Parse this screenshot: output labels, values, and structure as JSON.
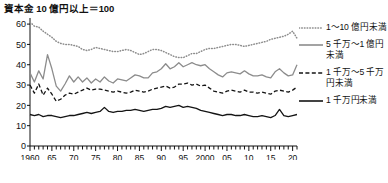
{
  "chart_data": {
    "type": "line",
    "title": "資本金 10 億円以上＝100",
    "xlabel": "",
    "ylabel": "",
    "xlim": [
      1960,
      2021
    ],
    "ylim": [
      0,
      63
    ],
    "yticks": [
      0,
      10,
      20,
      30,
      40,
      50,
      60
    ],
    "ytick_labels": [
      "0",
      "10",
      "20",
      "30",
      "40",
      "50",
      "60"
    ],
    "xticks": [
      1960,
      1965,
      1970,
      1975,
      1980,
      1985,
      1990,
      1995,
      2000,
      2005,
      2010,
      2015,
      2020
    ],
    "xtick_labels": [
      "1960",
      "65",
      "70",
      "75",
      "80",
      "85",
      "90",
      "95",
      "2000",
      "05",
      "10",
      "15",
      "20"
    ],
    "minor_tick_interval": 1,
    "grid": false,
    "legend_position": "right",
    "x": [
      1960,
      1961,
      1962,
      1963,
      1964,
      1965,
      1966,
      1967,
      1968,
      1969,
      1970,
      1971,
      1972,
      1973,
      1974,
      1975,
      1976,
      1977,
      1978,
      1979,
      1980,
      1981,
      1982,
      1983,
      1984,
      1985,
      1986,
      1987,
      1988,
      1989,
      1990,
      1991,
      1992,
      1993,
      1994,
      1995,
      1996,
      1997,
      1998,
      1999,
      2000,
      2001,
      2002,
      2003,
      2004,
      2005,
      2006,
      2007,
      2008,
      2009,
      2010,
      2011,
      2012,
      2013,
      2014,
      2015,
      2016,
      2017,
      2018,
      2019,
      2020,
      2021
    ],
    "series": [
      {
        "name": "1～10 億円未満",
        "style": "dotted",
        "color": "#8c8c8c",
        "values": [
          61.0,
          59.0,
          58.5,
          56.5,
          55.0,
          53.5,
          51.5,
          50.5,
          50.0,
          50.0,
          49.5,
          49.0,
          47.5,
          47.0,
          47.5,
          48.5,
          48.0,
          47.5,
          47.0,
          46.5,
          46.5,
          47.0,
          47.5,
          47.0,
          46.0,
          45.0,
          45.5,
          46.5,
          47.5,
          47.5,
          47.0,
          46.0,
          45.0,
          44.0,
          43.5,
          43.5,
          44.5,
          45.5,
          45.5,
          46.5,
          47.5,
          48.0,
          48.0,
          48.5,
          49.0,
          49.5,
          50.0,
          50.0,
          49.5,
          49.0,
          49.5,
          50.0,
          50.5,
          51.0,
          51.5,
          52.5,
          53.0,
          53.5,
          54.0,
          55.0,
          56.5,
          53.0
        ]
      },
      {
        "name": "5 千万～1 億円未満",
        "style": "solid",
        "color": "#8c8c8c",
        "values": [
          36.0,
          31.5,
          37.0,
          33.0,
          45.0,
          38.0,
          29.5,
          27.0,
          30.5,
          34.5,
          31.5,
          34.0,
          31.5,
          33.5,
          31.0,
          33.0,
          31.5,
          34.0,
          32.0,
          31.0,
          33.0,
          32.5,
          32.0,
          33.5,
          35.0,
          34.5,
          33.5,
          33.5,
          36.0,
          36.5,
          38.0,
          40.5,
          38.0,
          39.0,
          41.0,
          39.0,
          40.0,
          41.0,
          40.0,
          39.5,
          40.0,
          38.0,
          36.5,
          35.0,
          34.0,
          36.0,
          36.5,
          36.0,
          35.5,
          37.0,
          35.5,
          34.5,
          34.5,
          35.0,
          34.0,
          33.5,
          36.5,
          38.0,
          36.0,
          34.5,
          35.0,
          40.0
        ]
      },
      {
        "name": "1 千万～5 千万円未満",
        "style": "dashed",
        "color": "#141414",
        "values": [
          30.0,
          26.0,
          30.5,
          25.0,
          28.5,
          25.5,
          22.0,
          23.0,
          25.0,
          26.0,
          25.5,
          26.5,
          27.5,
          28.5,
          27.5,
          28.0,
          28.0,
          27.5,
          27.0,
          26.5,
          27.0,
          26.5,
          26.0,
          26.5,
          27.5,
          27.0,
          26.5,
          27.0,
          28.0,
          28.5,
          29.0,
          29.5,
          28.5,
          29.0,
          30.5,
          30.5,
          31.0,
          30.0,
          30.5,
          29.5,
          30.0,
          28.5,
          27.0,
          26.5,
          26.0,
          27.0,
          27.5,
          27.0,
          26.5,
          27.5,
          26.5,
          26.5,
          26.0,
          26.5,
          26.0,
          25.5,
          27.0,
          27.5,
          27.0,
          26.5,
          27.5,
          29.0
        ]
      },
      {
        "name": "1 千万円未満",
        "style": "solid",
        "color": "#141414",
        "values": [
          15.5,
          15.0,
          15.5,
          14.5,
          15.0,
          15.0,
          14.5,
          14.0,
          14.5,
          15.0,
          15.0,
          15.5,
          16.0,
          16.5,
          16.0,
          16.5,
          17.0,
          19.0,
          17.0,
          16.5,
          17.0,
          17.0,
          17.5,
          17.5,
          18.0,
          17.5,
          17.0,
          17.5,
          18.0,
          18.0,
          18.5,
          19.5,
          19.0,
          19.5,
          20.0,
          19.0,
          19.5,
          19.0,
          18.5,
          17.5,
          17.0,
          16.5,
          16.0,
          15.5,
          15.0,
          15.5,
          15.5,
          15.0,
          15.0,
          15.5,
          15.0,
          14.5,
          14.5,
          15.0,
          14.5,
          14.0,
          15.0,
          18.0,
          15.0,
          14.5,
          15.0,
          15.5
        ]
      }
    ]
  },
  "legend": {
    "entries": [
      {
        "label": "1～10 億円未満",
        "style": "dotted",
        "color": "#8c8c8c"
      },
      {
        "label": "5 千万～1 億円未満",
        "style": "solid",
        "color": "#8c8c8c"
      },
      {
        "label": "1 千万～5 千万円未満",
        "style": "dashed",
        "color": "#141414"
      },
      {
        "label": "1 千万円未満",
        "style": "solid",
        "color": "#141414"
      }
    ]
  },
  "axis": {
    "y_color": "#111111",
    "x_color": "#111111"
  },
  "footer": {
    "note": ""
  }
}
